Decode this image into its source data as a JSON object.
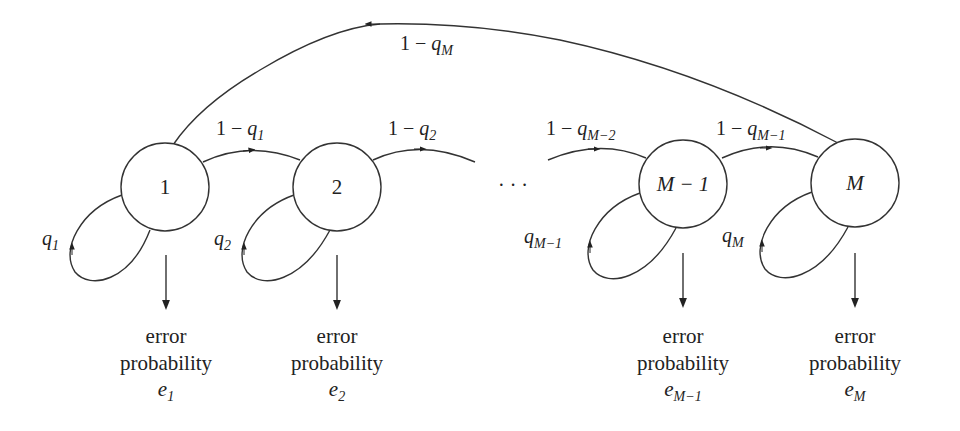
{
  "diagram": {
    "type": "markov-chain",
    "nodes": [
      {
        "id": "n1",
        "label": "1",
        "cx": 165,
        "cy": 187
      },
      {
        "id": "n2",
        "label": "2",
        "cx": 337,
        "cy": 187
      },
      {
        "id": "nM1",
        "label": "M − 1",
        "cx": 683,
        "cy": 184
      },
      {
        "id": "nM",
        "label": "M",
        "cx": 855,
        "cy": 183
      }
    ],
    "ellipsis": "· · ·",
    "forward_edges": [
      {
        "from": "1",
        "to": "2",
        "label_num": "1 − ",
        "label_var": "q",
        "label_sub": "1"
      },
      {
        "from": "2",
        "to": "…",
        "label_num": "1 − ",
        "label_var": "q",
        "label_sub": "2"
      },
      {
        "from": "…",
        "to": "M − 1",
        "label_num": "1 − ",
        "label_var": "q",
        "label_sub": "M−2"
      },
      {
        "from": "M − 1",
        "to": "M",
        "label_num": "1 − ",
        "label_var": "q",
        "label_sub": "M−1"
      }
    ],
    "return_edge": {
      "from": "M",
      "to": "1",
      "label_num": "1 − ",
      "label_var": "q",
      "label_sub": "M"
    },
    "self_loops": [
      {
        "node": "1",
        "label_var": "q",
        "label_sub": "1"
      },
      {
        "node": "2",
        "label_var": "q",
        "label_sub": "2"
      },
      {
        "node": "M − 1",
        "label_var": "q",
        "label_sub": "M−1"
      },
      {
        "node": "M",
        "label_var": "q",
        "label_sub": "M"
      }
    ],
    "outputs": [
      {
        "node": "1",
        "line1": "error",
        "line2": "probability",
        "var": "e",
        "sub": "1"
      },
      {
        "node": "2",
        "line1": "error",
        "line2": "probability",
        "var": "e",
        "sub": "2"
      },
      {
        "node": "M − 1",
        "line1": "error",
        "line2": "probability",
        "var": "e",
        "sub": "M−1"
      },
      {
        "node": "M",
        "line1": "error",
        "line2": "probability",
        "var": "e",
        "sub": "M"
      }
    ]
  }
}
